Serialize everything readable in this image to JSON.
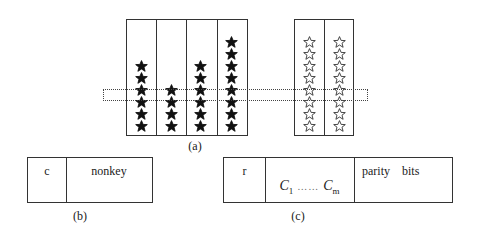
{
  "figure_a": {
    "caption": "(a)",
    "left_group": {
      "columns": [
        {
          "star_count": 6,
          "star_style": "filled"
        },
        {
          "star_count": 4,
          "star_style": "filled"
        },
        {
          "star_count": 6,
          "star_style": "filled"
        },
        {
          "star_count": 8,
          "star_style": "filled"
        }
      ]
    },
    "right_group": {
      "columns": [
        {
          "star_count": 8,
          "star_style": "outline"
        },
        {
          "star_count": 8,
          "star_style": "outline"
        }
      ]
    },
    "highlight_row": "dotted horizontal band spanning both groups"
  },
  "figure_b": {
    "caption": "(b)",
    "fields": [
      {
        "label": "c"
      },
      {
        "label": "nonkey"
      }
    ]
  },
  "figure_c": {
    "caption": "(c)",
    "fields": [
      {
        "label": "r"
      },
      {
        "label_start": "C",
        "sub_start": "1",
        "ellipsis": "……",
        "label_end": "C",
        "sub_end": "m"
      },
      {
        "label": "parity    bits"
      }
    ]
  },
  "colors": {
    "stroke": "#333333",
    "filled_star": "#111111",
    "outline_star": "#333333",
    "background": "#ffffff"
  }
}
